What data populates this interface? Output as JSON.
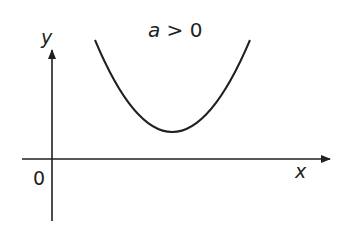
{
  "diagram": {
    "title": "a > 0",
    "title_parts": {
      "var": "a",
      "rest": " > 0"
    },
    "axes": {
      "x_label": "x",
      "y_label": "y",
      "origin_label": "0"
    },
    "curve": {
      "type": "parabola",
      "opens": "upward",
      "vertex_above_x_axis": true
    },
    "colors": {
      "line": "#231f20",
      "background": "#ffffff"
    }
  }
}
